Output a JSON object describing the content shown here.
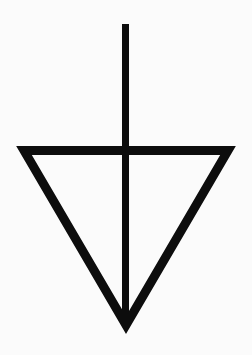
{
  "symbol": {
    "name": "downward-triangle-with-vertical-stem",
    "stroke_color": "#0d0d0d",
    "background_color": "#fbfbfb",
    "stem": {
      "x": 125.5,
      "y1": 24,
      "y2": 325,
      "width": 7
    },
    "triangle": {
      "points": [
        [
          24,
          150.5
        ],
        [
          228,
          150.5
        ],
        [
          126,
          325
        ]
      ],
      "stroke_width": 9
    }
  }
}
